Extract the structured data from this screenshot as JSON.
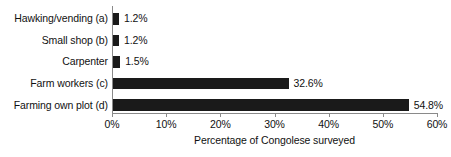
{
  "chart_data": {
    "type": "bar",
    "orientation": "horizontal",
    "title": "",
    "xlabel": "Percentage of Congolese surveyed",
    "ylabel": "",
    "categories": [
      "Hawking/vending (a)",
      "Small shop (b)",
      "Carpenter",
      "Farm workers (c)",
      "Farming own plot (d)"
    ],
    "values": [
      1.2,
      1.2,
      1.5,
      32.6,
      54.8
    ],
    "data_labels": [
      "1.2%",
      "1.2%",
      "1.5%",
      "32.6%",
      "54.8%"
    ],
    "xlim": [
      0,
      60
    ],
    "xticks": [
      0,
      10,
      20,
      30,
      40,
      50,
      60
    ],
    "xtick_labels": [
      "0%",
      "10%",
      "20%",
      "30%",
      "40%",
      "50%",
      "60%"
    ],
    "grid": false,
    "legend": false,
    "bar_color": "#1a1a1a",
    "axis_color": "#8a8a8a",
    "background_color": "#ffffff",
    "text_color": "#111111"
  }
}
